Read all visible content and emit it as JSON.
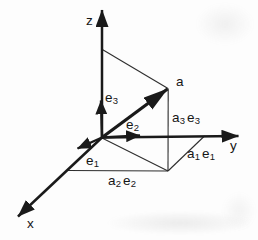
{
  "figure": {
    "type": "3d-vector-decomposition-diagram",
    "ink_color": "#1a1a1a",
    "thin_line_color": "#2e2e2e",
    "background_color": "#fdfdfd",
    "axes": {
      "x": "x",
      "y": "y",
      "z": "z"
    },
    "vector": {
      "label": "a"
    },
    "basis_vectors": {
      "e1": {
        "symbol": "e",
        "subscript": "1"
      },
      "e2": {
        "symbol": "e",
        "subscript": "2"
      },
      "e3": {
        "symbol": "e",
        "subscript": "3"
      }
    },
    "components": {
      "a1e1": {
        "coeff": "a",
        "coeff_sub": "1",
        "basis": "e",
        "basis_sub": "1"
      },
      "a2e2": {
        "coeff": "a",
        "coeff_sub": "2",
        "basis": "e",
        "basis_sub": "2"
      },
      "a3e3": {
        "coeff": "a",
        "coeff_sub": "3",
        "basis": "e",
        "basis_sub": "3"
      }
    }
  }
}
